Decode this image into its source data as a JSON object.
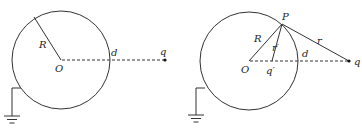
{
  "diagrams": [
    {
      "id": "left",
      "labels": {
        "radius": "R",
        "center": "O",
        "distance": "d",
        "charge": "q"
      }
    },
    {
      "id": "right",
      "labels": {
        "radius": "R",
        "center": "O",
        "distance": "d",
        "charge": "q",
        "point": "P",
        "r": "r",
        "r_prime": "r′",
        "image_charge": "q′"
      }
    }
  ],
  "colors": {
    "stroke": "#333333",
    "background": "#ffffff"
  }
}
